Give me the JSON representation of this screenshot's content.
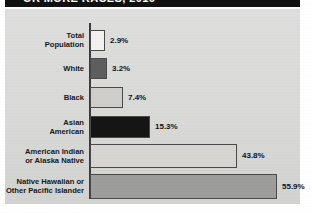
{
  "title": {
    "text": "OR MORE RACES, 2016",
    "banner_color": "#111111",
    "text_color": "#ffffff"
  },
  "panel": {
    "background_color": "#dcdcda",
    "axis_color": "#3b3b3b"
  },
  "chart_data": {
    "type": "bar",
    "orientation": "horizontal",
    "title": "OR MORE RACES, 2016",
    "xlabel": "",
    "ylabel": "",
    "xlim": [
      0,
      60
    ],
    "grid": false,
    "legend": false,
    "value_suffix": "%",
    "categories": [
      "Total\nPopulation",
      "White",
      "Black",
      "Asian\nAmerican",
      "American Indian\nor Alaska Native",
      "Native Hawaiian or\nOther Pacific Islander"
    ],
    "values": [
      2.9,
      3.2,
      7.4,
      15.3,
      43.8,
      55.9
    ],
    "value_labels": [
      "2.9%",
      "3.2%",
      "7.4%",
      "15.3%",
      "43.8%",
      "55.9%"
    ],
    "bar_colors": [
      "#f2f1ef",
      "#5e5e5e",
      "#cfcecb",
      "#151515",
      "#d6d5d2",
      "#9d9d9b"
    ],
    "bar_edge_color": "#4a4a4a"
  },
  "bars": [
    {
      "label": "Total\nPopulation",
      "value_label": "2.9%",
      "width_px": 15,
      "top_px": 15,
      "height_px": 21,
      "color": "#f2f1ef"
    },
    {
      "label": "White",
      "value_label": "3.2%",
      "width_px": 17,
      "top_px": 43,
      "height_px": 21,
      "color": "#5e5e5e"
    },
    {
      "label": "Black",
      "value_label": "7.4%",
      "width_px": 33,
      "top_px": 72,
      "height_px": 21,
      "color": "#cfcecb"
    },
    {
      "label": "Asian\nAmerican",
      "value_label": "15.3%",
      "width_px": 60,
      "top_px": 101,
      "height_px": 22,
      "color": "#151515"
    },
    {
      "label": "American Indian\nor Alaska Native",
      "value_label": "43.8%",
      "width_px": 147,
      "top_px": 129,
      "height_px": 24,
      "color": "#d6d5d2"
    },
    {
      "label": "Native Hawaiian or\nOther Pacific Islander",
      "value_label": "55.9%",
      "width_px": 187,
      "top_px": 159,
      "height_px": 25,
      "color": "#9d9d9b"
    }
  ]
}
